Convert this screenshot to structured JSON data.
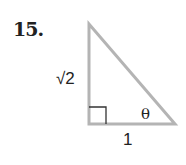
{
  "problem": {
    "number": "15."
  },
  "figure": {
    "type": "right-triangle",
    "stroke_color": "#b4b4b4",
    "labels": {
      "vertical_leg": "√2",
      "horizontal_leg": "1",
      "angle": "θ"
    },
    "right_angle_marker": true
  }
}
